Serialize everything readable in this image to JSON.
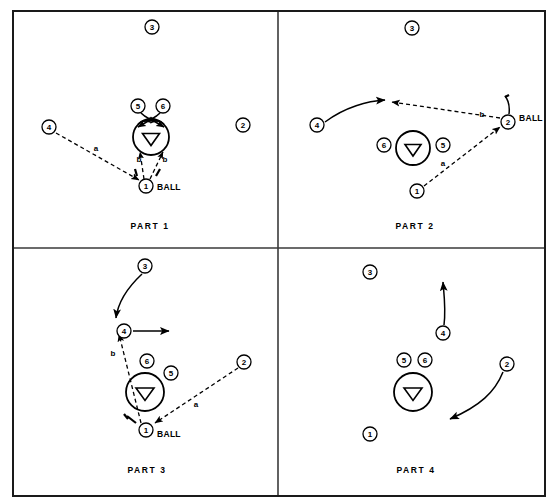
{
  "figure": {
    "type": "basketball-play-diagram",
    "title": "",
    "panel_count": 4,
    "background_color": "#ffffff",
    "ink_color": "#000000",
    "border_color": "#1a1a1a",
    "canvas": {
      "width": 555,
      "height": 504
    },
    "frame": {
      "x": 12,
      "y": 10,
      "width": 533,
      "height": 486
    },
    "divider_x": 278,
    "divider_y": 248
  },
  "legend": {
    "solid_line_meaning": "player movement",
    "dashed_line_meaning": "pass",
    "heavy_short_line_meaning": "screen"
  },
  "panels": [
    {
      "id": "part-1",
      "label": "PART 1",
      "label_pos": {
        "x": 150,
        "y": 226
      },
      "bounds": {
        "x": 14,
        "y": 12,
        "width": 262,
        "height": 234
      },
      "key_circle": {
        "cx": 151,
        "cy": 137,
        "r": 18
      },
      "key_triangle": {
        "cx": 151,
        "cy": 139,
        "size": 13
      },
      "players": [
        {
          "num": "3",
          "x": 152,
          "y": 27,
          "r": 7
        },
        {
          "num": "2",
          "x": 243,
          "y": 125,
          "r": 7
        },
        {
          "num": "4",
          "x": 49,
          "y": 127,
          "r": 7
        },
        {
          "num": "5",
          "x": 138,
          "y": 106,
          "r": 7
        },
        {
          "num": "6",
          "x": 163,
          "y": 106,
          "r": 7
        },
        {
          "num": "1",
          "x": 146,
          "y": 186,
          "r": 7
        }
      ],
      "ball_holder": "1",
      "ball_label": {
        "text": "BALL",
        "x": 157,
        "y": 187
      },
      "segment_labels": [
        {
          "text": "a",
          "x": 96,
          "y": 148
        },
        {
          "text": "b",
          "x": 139,
          "y": 159
        },
        {
          "text": "b",
          "x": 165,
          "y": 159
        }
      ]
    },
    {
      "id": "part-2",
      "label": "PART 2",
      "label_pos": {
        "x": 415,
        "y": 226
      },
      "bounds": {
        "x": 280,
        "y": 12,
        "width": 263,
        "height": 234
      },
      "key_circle": {
        "cx": 413,
        "cy": 148,
        "r": 17
      },
      "key_triangle": {
        "cx": 413,
        "cy": 150,
        "size": 13
      },
      "players": [
        {
          "num": "3",
          "x": 412,
          "y": 28,
          "r": 7
        },
        {
          "num": "4",
          "x": 317,
          "y": 125,
          "r": 7
        },
        {
          "num": "6",
          "x": 384,
          "y": 145,
          "r": 7
        },
        {
          "num": "5",
          "x": 443,
          "y": 145,
          "r": 7
        },
        {
          "num": "1",
          "x": 417,
          "y": 191,
          "r": 7
        },
        {
          "num": "2",
          "x": 508,
          "y": 122,
          "r": 7
        }
      ],
      "ball_holder": "2",
      "ball_label": {
        "text": "BALL",
        "x": 519,
        "y": 118
      },
      "segment_labels": [
        {
          "text": "b",
          "x": 482,
          "y": 114
        },
        {
          "text": "a",
          "x": 443,
          "y": 163
        }
      ]
    },
    {
      "id": "part-3",
      "label": "PART 3",
      "label_pos": {
        "x": 147,
        "y": 470
      },
      "bounds": {
        "x": 14,
        "y": 250,
        "width": 262,
        "height": 240
      },
      "key_circle": {
        "cx": 145,
        "cy": 392,
        "r": 19
      },
      "key_triangle": {
        "cx": 145,
        "cy": 394,
        "size": 14
      },
      "players": [
        {
          "num": "3",
          "x": 145,
          "y": 266,
          "r": 7
        },
        {
          "num": "4",
          "x": 124,
          "y": 331,
          "r": 7
        },
        {
          "num": "6",
          "x": 147,
          "y": 361,
          "r": 7
        },
        {
          "num": "5",
          "x": 171,
          "y": 373,
          "r": 7
        },
        {
          "num": "1",
          "x": 146,
          "y": 430,
          "r": 7
        },
        {
          "num": "2",
          "x": 244,
          "y": 362,
          "r": 7
        }
      ],
      "ball_holder": "1",
      "ball_label": {
        "text": "BALL",
        "x": 157,
        "y": 434
      },
      "segment_labels": [
        {
          "text": "b",
          "x": 113,
          "y": 353
        },
        {
          "text": "a",
          "x": 196,
          "y": 404
        }
      ]
    },
    {
      "id": "part-4",
      "label": "PART 4",
      "label_pos": {
        "x": 416,
        "y": 470
      },
      "bounds": {
        "x": 280,
        "y": 250,
        "width": 263,
        "height": 240
      },
      "key_circle": {
        "cx": 413,
        "cy": 392,
        "r": 19
      },
      "key_triangle": {
        "cx": 413,
        "cy": 394,
        "size": 14
      },
      "players": [
        {
          "num": "3",
          "x": 370,
          "y": 272,
          "r": 7
        },
        {
          "num": "4",
          "x": 443,
          "y": 333,
          "r": 7
        },
        {
          "num": "5",
          "x": 404,
          "y": 360,
          "r": 7
        },
        {
          "num": "6",
          "x": 425,
          "y": 360,
          "r": 7
        },
        {
          "num": "1",
          "x": 370,
          "y": 434,
          "r": 7
        },
        {
          "num": "2",
          "x": 507,
          "y": 364,
          "r": 7
        }
      ],
      "ball_holder": null,
      "ball_label": null,
      "segment_labels": []
    }
  ]
}
